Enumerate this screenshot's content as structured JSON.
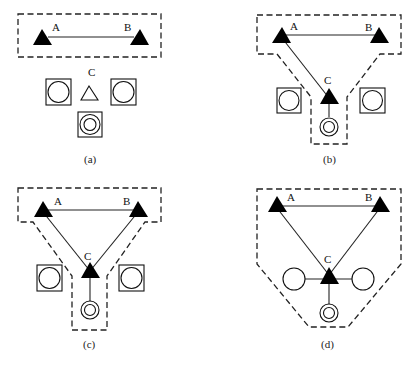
{
  "figure": {
    "panels": [
      {
        "id": "a",
        "caption": "(a)",
        "labels": {
          "A": "A",
          "B": "B",
          "C": "C"
        }
      },
      {
        "id": "b",
        "caption": "(b)",
        "labels": {
          "A": "A",
          "B": "B",
          "C": "C"
        }
      },
      {
        "id": "c",
        "caption": "(c)",
        "labels": {
          "A": "A",
          "B": "B",
          "C": "C"
        }
      },
      {
        "id": "d",
        "caption": "(d)",
        "labels": {
          "A": "A",
          "B": "B",
          "C": "C"
        }
      }
    ],
    "legend_icons": [
      "filled-triangle-node",
      "hollow-triangle-node",
      "square-circle-node",
      "double-circle-node",
      "plain-circle-node",
      "dashed-boundary"
    ],
    "colors": {
      "stroke": "#222222",
      "fill": "#000000",
      "background": "#ffffff"
    }
  }
}
